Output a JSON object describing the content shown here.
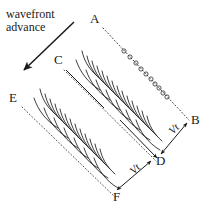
{
  "figure": {
    "caption": {
      "line1": "wavefront",
      "line2": "advance"
    },
    "colors": {
      "ink": "#1a1a1a",
      "background": "#ffffff",
      "dotted": "#4a4a4a"
    },
    "points": [
      {
        "id": "A",
        "label": "A",
        "x": 96,
        "y": 22
      },
      {
        "id": "B",
        "label": "B",
        "x": 196,
        "y": 124
      },
      {
        "id": "C",
        "label": "C",
        "x": 59,
        "y": 62
      },
      {
        "id": "D",
        "label": "D",
        "x": 159,
        "y": 163
      },
      {
        "id": "E",
        "label": "E",
        "x": 14,
        "y": 100
      },
      {
        "id": "F",
        "label": "F",
        "x": 118,
        "y": 199
      }
    ],
    "velocity_labels": [
      {
        "id": "vt-upper",
        "label": "Vt",
        "x": 170,
        "y": 133,
        "rotation": -45
      },
      {
        "id": "vt-lower",
        "label": "Vt",
        "x": 131,
        "y": 171,
        "rotation": -45
      }
    ],
    "advance_arrow": {
      "name": "wavefront-advance-arrow",
      "from_x": 74,
      "from_y": 22,
      "to_x": 22,
      "to_y": 72
    },
    "dotted_lines": [
      {
        "name": "line-A-B",
        "x1": 103,
        "y1": 28,
        "x2": 189,
        "y2": 120,
        "circles": 13
      },
      {
        "name": "line-C-D",
        "x1": 63,
        "y1": 70,
        "x2": 155,
        "y2": 160
      },
      {
        "name": "line-E-F",
        "x1": 22,
        "y1": 107,
        "x2": 114,
        "y2": 196
      }
    ],
    "fracture_arrays": [
      {
        "name": "upper-array",
        "x1": 66,
        "y1": 62,
        "x2": 152,
        "y2": 156,
        "blades": 17
      },
      {
        "name": "lower-array",
        "x1": 24,
        "y1": 100,
        "x2": 112,
        "y2": 193,
        "blades": 17
      }
    ],
    "vector_arrows": [
      {
        "name": "arrow-B-to-D",
        "x1": 188,
        "y1": 122,
        "x2": 160,
        "y2": 155
      },
      {
        "name": "arrow-D-to-B",
        "x1": 160,
        "y1": 155,
        "x2": 188,
        "y2": 122
      },
      {
        "name": "arrow-F-to-D",
        "x1": 116,
        "y1": 190,
        "x2": 150,
        "y2": 160
      },
      {
        "name": "arrow-D-to-F",
        "x1": 150,
        "y1": 160,
        "x2": 116,
        "y2": 190
      }
    ]
  }
}
